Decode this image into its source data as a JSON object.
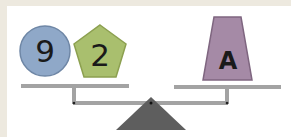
{
  "scale": {
    "left_pan": {
      "items": [
        {
          "shape": "circle",
          "label": "9",
          "color": "#8fa8c8"
        },
        {
          "shape": "pentagon",
          "label": "2",
          "color": "#a9bf6e"
        }
      ]
    },
    "right_pan": {
      "items": [
        {
          "shape": "trapezoid",
          "label": "A",
          "color": "#a58aa6"
        }
      ]
    },
    "beam_color": "#a3a3a3",
    "fulcrum_color": "#5e5e5e",
    "background_color": "#ede9df"
  }
}
